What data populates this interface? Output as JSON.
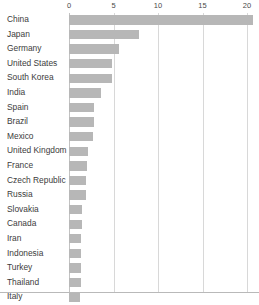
{
  "chart_data": {
    "type": "bar",
    "orientation": "horizontal",
    "title": "",
    "subtitle": "",
    "xlabel": "",
    "ylabel": "",
    "xlim": [
      0,
      21
    ],
    "xticks": [
      0,
      5,
      10,
      15,
      20
    ],
    "xtick_labels": [
      "0",
      "5",
      "10",
      "15",
      "20"
    ],
    "grid": true,
    "grid_axis": "x",
    "legend": false,
    "legend_position": "none",
    "bar_color": "#b7b7b7",
    "grid_color": "#d8d8d8",
    "axis_color": "#c2c2c2",
    "background_color": "#ffffff",
    "categories": [
      "China",
      "Japan",
      "Germany",
      "United States",
      "South Korea",
      "India",
      "Spain",
      "Brazil",
      "Mexico",
      "United Kingdom",
      "France",
      "Czech Republic",
      "Russia",
      "Slovakia",
      "Canada",
      "Iran",
      "Indonesia",
      "Turkey",
      "Thailand",
      "Italy"
    ],
    "values": [
      20.7,
      7.9,
      5.6,
      4.8,
      4.8,
      3.6,
      2.8,
      2.8,
      2.7,
      2.1,
      2.0,
      1.9,
      1.9,
      1.5,
      1.5,
      1.4,
      1.4,
      1.3,
      1.3,
      1.2
    ]
  }
}
